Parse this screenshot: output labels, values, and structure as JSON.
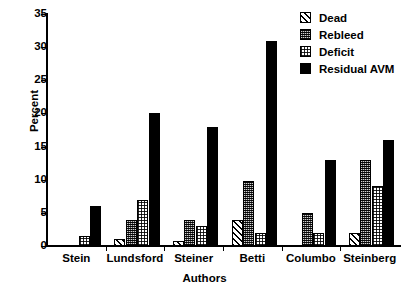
{
  "chart_data": {
    "type": "bar",
    "title": "",
    "subtitle": "",
    "xlabel": "Authors",
    "ylabel": "Percent",
    "categories": [
      "Stein",
      "Lundsford",
      "Steiner",
      "Betti",
      "Columbo",
      "Steinberg"
    ],
    "series": [
      {
        "name": "Dead",
        "values": [
          0,
          1,
          0.7,
          4,
          0,
          2
        ],
        "pattern": "diagonal-hatch",
        "color": "#ffffff"
      },
      {
        "name": "Rebleed",
        "values": [
          0,
          4,
          4,
          9.8,
          5,
          13
        ],
        "pattern": "dark-stipple",
        "color": "#4a4a4a"
      },
      {
        "name": "Deficit",
        "values": [
          1.5,
          7,
          3,
          2,
          2,
          9
        ],
        "pattern": "light-checker",
        "color": "#ffffff"
      },
      {
        "name": "Residual AVM",
        "values": [
          6,
          20,
          18,
          31,
          13,
          16
        ],
        "pattern": "solid",
        "color": "#000000"
      }
    ],
    "ylim": [
      0,
      35
    ],
    "yticks": [
      0,
      5,
      10,
      15,
      20,
      25,
      30,
      35
    ],
    "ytick_labels": [
      "0",
      "5",
      "10",
      "15",
      "20",
      "25",
      "30",
      "35"
    ],
    "grid": false,
    "legend_position": "top-right",
    "legend_entries": [
      "Dead",
      "Rebleed",
      "Deficit",
      "Residual AVM"
    ]
  }
}
